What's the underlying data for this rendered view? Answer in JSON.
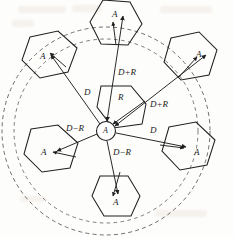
{
  "figure": {
    "stroke_color": "#1f1f1f",
    "dash_color": "#6a6a6a",
    "background": "#fdfdfc"
  },
  "center_cell": {
    "label_A": "A",
    "radius_label": "R"
  },
  "cells": [
    {
      "id": "top",
      "label": "A"
    },
    {
      "id": "top-left",
      "label": "A"
    },
    {
      "id": "top-right",
      "label": "A"
    },
    {
      "id": "bottom-left",
      "label": "A"
    },
    {
      "id": "bottom-right",
      "label": "A"
    },
    {
      "id": "bottom",
      "label": "A"
    }
  ],
  "measures": [
    {
      "id": "d-plus-r-top",
      "label": "D+R"
    },
    {
      "id": "d-plus-r-right",
      "label": "D+R"
    },
    {
      "id": "d-upper-left",
      "label": "D"
    },
    {
      "id": "d-right",
      "label": "D"
    },
    {
      "id": "d-minus-r-left",
      "label": "D−R"
    },
    {
      "id": "d-minus-r-bottom",
      "label": "D−R"
    },
    {
      "id": "radius",
      "label": "R"
    }
  ]
}
